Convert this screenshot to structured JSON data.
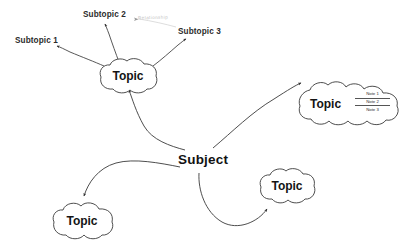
{
  "diagram": {
    "type": "mind-map",
    "background_color": "#ffffff",
    "stroke_color": "#3a3a3a",
    "text_color": "#141414",
    "center": {
      "label": "Subject",
      "shape": "plain-text"
    },
    "topics": [
      {
        "id": "topic-top",
        "label": "Topic",
        "shape": "cloud",
        "position": "top-left"
      },
      {
        "id": "topic-right-notes",
        "label": "Topic",
        "shape": "cloud",
        "position": "right",
        "notes": [
          "Note 1",
          "Note 2",
          "Note 3"
        ]
      },
      {
        "id": "topic-bottom-right",
        "label": "Topic",
        "shape": "cloud",
        "position": "bottom-right"
      },
      {
        "id": "topic-bottom-left",
        "label": "Topic",
        "shape": "cloud",
        "position": "bottom-left"
      }
    ],
    "subtopics": [
      {
        "id": "subtopic-1",
        "label": "Subtopic 1"
      },
      {
        "id": "subtopic-2",
        "label": "Subtopic 2"
      },
      {
        "id": "subtopic-3",
        "label": "Subtopic 3"
      }
    ],
    "annotation": {
      "label": "Relationship",
      "style": "faint"
    }
  }
}
